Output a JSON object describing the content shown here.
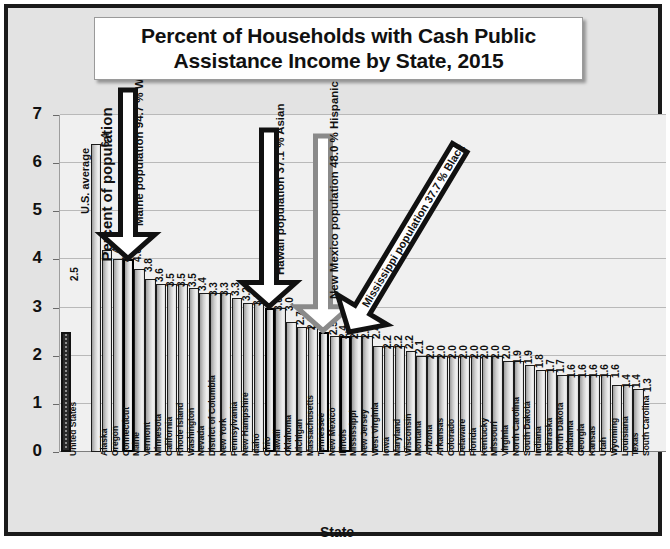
{
  "chart_data": {
    "type": "bar",
    "title": "Percent of Households with Cash Public Assistance Income by State, 2015",
    "title_line1": "Percent of Households with Cash Public",
    "title_line2": "Assistance Income by State, 2015",
    "xlabel": "State",
    "ylabel": "Percent of population",
    "ylim": [
      0,
      7
    ],
    "yticks": [
      0,
      1,
      2,
      3,
      4,
      5,
      6,
      7
    ],
    "grid": true,
    "legend": "none",
    "reference": {
      "label": "U.S. average",
      "category": "United States",
      "value": 2.5
    },
    "categories": [
      "United States",
      "Alaska",
      "Oregon",
      "Connecticut",
      "Maine",
      "Vermont",
      "Minnesota",
      "California",
      "Rhode Island",
      "Washington",
      "Nevada",
      "District of Columbia",
      "New York",
      "Pennsylvania",
      "New Hampshire",
      "Idaho",
      "Ohio",
      "Hawaii",
      "Oklahoma",
      "Michigan",
      "Massachusetts",
      "Tennessee",
      "New Mexico",
      "Illinois",
      "Mississippi",
      "New Jersey",
      "West Virginia",
      "Iowa",
      "Maryland",
      "Wisconsin",
      "Montana",
      "Arizona",
      "Arkansas",
      "Colorado",
      "Delaware",
      "Florida",
      "Kentucky",
      "Missouri",
      "Virginia",
      "North Carolina",
      "South Dakota",
      "Indiana",
      "Nebraska",
      "North Dakota",
      "Alabama",
      "Georgia",
      "Kansas",
      "Utah",
      "Wyoming",
      "Louisiana",
      "Texas",
      "South Carolina"
    ],
    "values": [
      2.5,
      6.4,
      4.2,
      4.0,
      4.0,
      3.8,
      3.6,
      3.5,
      3.5,
      3.5,
      3.4,
      3.3,
      3.3,
      3.3,
      3.2,
      3.1,
      3.1,
      3.0,
      3.0,
      2.7,
      2.6,
      2.6,
      2.5,
      2.4,
      2.4,
      2.4,
      2.4,
      2.2,
      2.2,
      2.2,
      2.1,
      2.0,
      2.0,
      2.0,
      2.0,
      2.0,
      2.0,
      2.0,
      2.0,
      1.9,
      1.9,
      1.8,
      1.7,
      1.7,
      1.6,
      1.6,
      1.6,
      1.6,
      1.6,
      1.4,
      1.4,
      1.3
    ],
    "value_labels": [
      "2.5",
      "6.4",
      "4.2",
      "4.0",
      "4.0",
      "3.8",
      "3.6",
      "3.5",
      "3.5",
      "3.5",
      "3.4",
      "3.3",
      "3.3",
      "3.3",
      "3.2",
      "3.1",
      "3.1",
      "3.0",
      "3.0",
      "2.7",
      "2.6",
      "2.6",
      "2.5",
      "2.4",
      "2.4",
      "2.4",
      "2.4",
      "2.2",
      "2.2",
      "2.2",
      "2.1",
      "2.0",
      "2.0",
      "2.0",
      "2.0",
      "2.0",
      "2.0",
      "2.0",
      "2.0",
      "1.9",
      "1.9",
      "1.8",
      "1.7",
      "1.7",
      "1.6",
      "1.6",
      "1.6",
      "1.6",
      "1.6",
      "1.4",
      "1.4",
      "1.3"
    ],
    "highlighted": [
      "Maine",
      "Hawaii",
      "New Mexico",
      "Mississippi"
    ],
    "annotations": [
      {
        "text": "Maine population 94.7 % White",
        "target": "Maine",
        "color": "#111111",
        "style": "vertical-down"
      },
      {
        "text": "Hawaii population 37.1 % Asian",
        "target": "Hawaii",
        "color": "#111111",
        "style": "vertical-down"
      },
      {
        "text": "New Mexico population 48.0 % Hispanic",
        "target": "New Mexico",
        "color": "#8a8a8a",
        "style": "vertical-down"
      },
      {
        "text": "Mississippi population 37.7 % Black",
        "target": "Mississippi",
        "color": "#111111",
        "style": "diagonal-down-left"
      }
    ]
  },
  "colors": {
    "frame": "#1a1a1a",
    "background": "#e3e3e3",
    "plot_background": "#f0f0f0",
    "gridline": "#b9b9b9",
    "bar_outline": "#1c1c1c",
    "accent_gray_arrow": "#8a8a8a"
  }
}
